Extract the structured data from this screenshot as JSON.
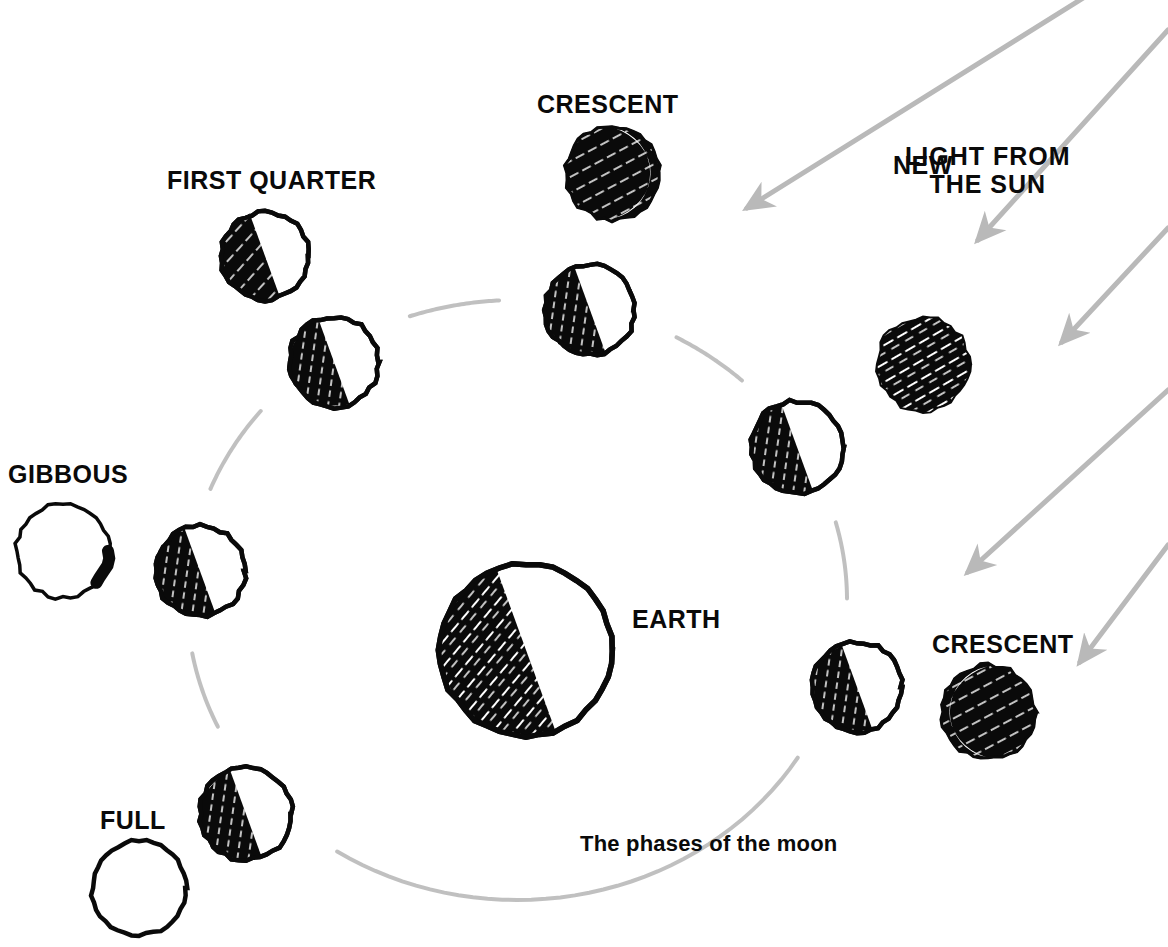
{
  "diagram": {
    "title": "The phases of the moon",
    "caption": "The phases of the moon",
    "background_color": "#ffffff",
    "ink_color": "#0a0a0a",
    "ray_color": "#b9b9b9",
    "orbit_color": "#bdbdbd"
  },
  "labels": {
    "first_quarter": "FIRST QUARTER",
    "crescent_top": "CRESCENT",
    "light_from_sun_line1": "LIGHT FROM",
    "light_from_sun_line2": "THE SUN",
    "new": "NEW",
    "gibbous": "GIBBOUS",
    "earth": "EARTH",
    "crescent_bottom": "CRESCENT",
    "full": "FULL",
    "caption": "The phases of the moon"
  },
  "earth": {
    "name": "EARTH",
    "cx": 526,
    "cy": 650,
    "r": 86,
    "lit_side": "right",
    "terminator_angle_deg": 20
  },
  "orbit": {
    "cx": 517,
    "cy": 600,
    "rx": 330,
    "ry": 300,
    "stroke": "#bdbdbd",
    "stroke_width": 4,
    "dashed_gaps_at_moons": true
  },
  "orbit_moons": [
    {
      "id": "orbit-moon-1",
      "cx": 590,
      "cy": 310,
      "r": 45,
      "lit_side": "right",
      "phase": "half"
    },
    {
      "id": "orbit-moon-2",
      "cx": 797,
      "cy": 447,
      "r": 46,
      "lit_side": "right",
      "phase": "half"
    },
    {
      "id": "orbit-moon-3",
      "cx": 857,
      "cy": 687,
      "r": 45,
      "lit_side": "right",
      "phase": "half"
    },
    {
      "id": "orbit-moon-4",
      "cx": 246,
      "cy": 814,
      "r": 46,
      "lit_side": "right",
      "phase": "half"
    },
    {
      "id": "orbit-moon-5",
      "cx": 200,
      "cy": 571,
      "r": 45,
      "lit_side": "right",
      "phase": "half"
    },
    {
      "id": "orbit-moon-6",
      "cx": 334,
      "cy": 362,
      "r": 45,
      "lit_side": "right",
      "phase": "half"
    }
  ],
  "phase_moons": [
    {
      "id": "phase-moon-first-quarter",
      "label": "FIRST QUARTER",
      "cx": 265,
      "cy": 256,
      "r": 44,
      "phase": "half",
      "lit_side": "right"
    },
    {
      "id": "phase-moon-crescent-top",
      "label": "CRESCENT",
      "cx": 612,
      "cy": 173,
      "r": 47,
      "phase": "crescent",
      "lit_side": "right"
    },
    {
      "id": "phase-moon-new",
      "label": "NEW",
      "cx": 923,
      "cy": 364,
      "r": 47,
      "phase": "new",
      "lit_side": "none"
    },
    {
      "id": "phase-moon-gibbous",
      "label": "GIBBOUS",
      "cx": 63,
      "cy": 551,
      "r": 47,
      "phase": "gibbous",
      "lit_side": "right"
    },
    {
      "id": "phase-moon-crescent-bottom",
      "label": "CRESCENT",
      "cx": 988,
      "cy": 712,
      "r": 47,
      "phase": "crescent",
      "lit_side": "left"
    },
    {
      "id": "phase-moon-full",
      "label": "FULL",
      "cx": 139,
      "cy": 888,
      "r": 47,
      "phase": "full",
      "lit_side": "all"
    }
  ],
  "sun_rays": [
    {
      "id": "sun-ray-1",
      "x1": 1168,
      "y1": -55,
      "x2": 747,
      "y2": 208
    },
    {
      "id": "sun-ray-2",
      "x1": 1168,
      "y1": 30,
      "x2": 978,
      "y2": 240
    },
    {
      "id": "sun-ray-3",
      "x1": 1168,
      "y1": 228,
      "x2": 1062,
      "y2": 342
    },
    {
      "id": "sun-ray-4",
      "x1": 1168,
      "y1": 390,
      "x2": 968,
      "y2": 572
    },
    {
      "id": "sun-ray-5",
      "x1": 1168,
      "y1": 545,
      "x2": 1080,
      "y2": 662
    }
  ],
  "label_positions": {
    "first_quarter": {
      "left": 167,
      "top": 166
    },
    "crescent_top": {
      "left": 537,
      "top": 90
    },
    "light_from_sun": {
      "left": 905,
      "top": 142
    },
    "new": {
      "left": 893,
      "top": 151
    },
    "gibbous": {
      "left": 8,
      "top": 460
    },
    "earth": {
      "left": 632,
      "top": 605
    },
    "crescent_bottom": {
      "left": 932,
      "top": 630
    },
    "full": {
      "left": 100,
      "top": 806
    },
    "caption": {
      "left": 580,
      "top": 832
    }
  }
}
